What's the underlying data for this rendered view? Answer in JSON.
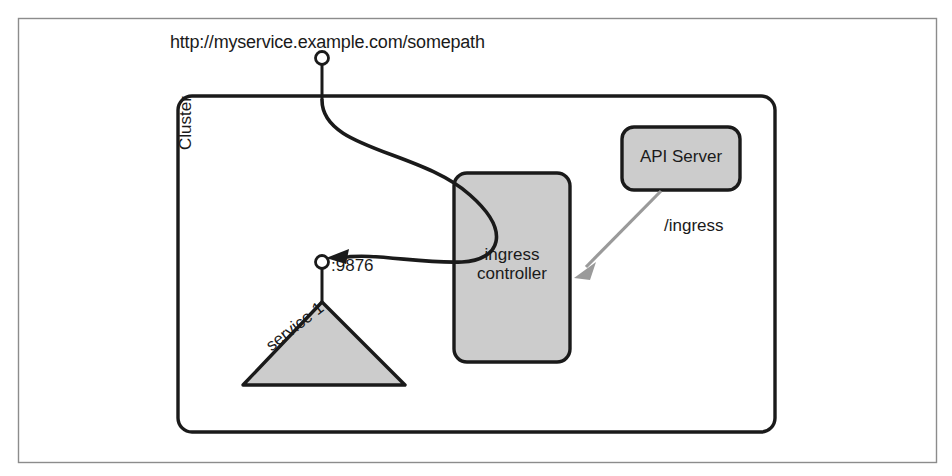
{
  "figure": {
    "background": "#ffffff",
    "border_color": "#8c8c8c",
    "shape_fill": "#cccccc",
    "shape_stroke": "#1a1a1a",
    "arrow_gray": "#9a9a9a"
  },
  "labels": {
    "url": "http://myservice.example.com/somepath",
    "cluster": "Cluster",
    "ingress_controller": "ingress controller",
    "api_server": "API Server",
    "ingress_path": "/ingress",
    "port": ":9876",
    "service": "service 1"
  }
}
